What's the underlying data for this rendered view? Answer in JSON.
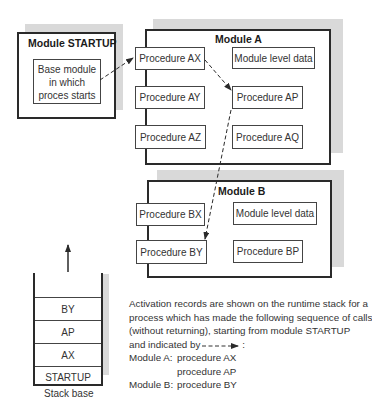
{
  "module_startup": {
    "title": "Module STARTUP",
    "base_box": {
      "line1": "Base module",
      "line2": "in which",
      "line3": "proces starts"
    }
  },
  "module_a": {
    "title": "Module A",
    "procedures": {
      "ax": "Procedure AX",
      "ay": "Procedure AY",
      "az": "Procedure AZ",
      "ap": "Procedure AP",
      "aq": "Procedure AQ"
    },
    "data_box": "Module level data"
  },
  "module_b": {
    "title": "Module B",
    "procedures": {
      "bx": "Procedure BX",
      "by": "Procedure BY",
      "bp": "Procedure BP"
    },
    "data_box": "Module level data"
  },
  "stack": {
    "records": [
      "BY",
      "AP",
      "AX",
      "STARTUP"
    ],
    "base_label": "Stack base"
  },
  "caption": {
    "line1": "Activation records are shown on the runtime stack for a",
    "line2": "process which has made the following sequence of calls",
    "line3": "(without returning), starting from module STARTUP",
    "line4": "and indicated by",
    "line4_suffix": ":",
    "calls": [
      {
        "module": "Module A:",
        "procedure": "procedure AX"
      },
      {
        "module": "",
        "procedure": "procedure AP"
      },
      {
        "module": "Module B:",
        "procedure": "procedure BY"
      }
    ]
  },
  "colors": {
    "line": "#2a2a2a",
    "shadow": "#d9d9d9",
    "text": "#333333"
  }
}
